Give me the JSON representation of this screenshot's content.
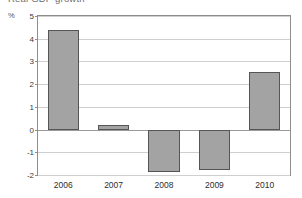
{
  "title_partial": "Real GDP growth",
  "unit_label": "%",
  "chart_data": {
    "type": "bar",
    "title": "Real GDP growth",
    "xlabel": "",
    "ylabel": "%",
    "categories": [
      "2006",
      "2007",
      "2008",
      "2009",
      "2010"
    ],
    "values": [
      4.4,
      0.2,
      -1.87,
      -1.8,
      2.55
    ],
    "ylim": [
      -2,
      5
    ],
    "yticks": [
      5,
      4,
      3,
      2,
      1,
      0,
      -1,
      -2
    ],
    "ytick_labels": [
      "5",
      "4",
      "3",
      "2",
      "1",
      "0",
      "-1",
      "-2"
    ],
    "grid": true,
    "legend": "none",
    "bar_color": "#a3a3a3",
    "bar_border_color": "#555555",
    "grid_color": "#cfcfcf",
    "axis_color": "#8d8d8d"
  }
}
